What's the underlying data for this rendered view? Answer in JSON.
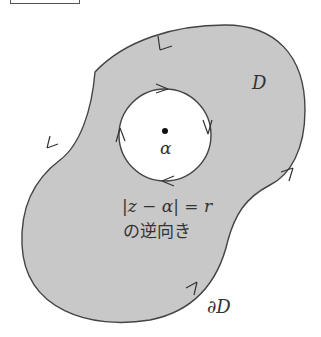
{
  "diagram": {
    "type": "complex-analysis-domain",
    "region_label": "D",
    "boundary_label": "∂D",
    "center_point_label": "α",
    "circle_equation": "|z − α| = r",
    "circle_note": "の逆向き",
    "colors": {
      "region_fill": "#c8c8c8",
      "outline": "#444444",
      "background": "#ffffff",
      "hole_fill": "#ffffff"
    },
    "orientation": {
      "outer_boundary": "counterclockwise",
      "inner_circle": "clockwise"
    }
  }
}
